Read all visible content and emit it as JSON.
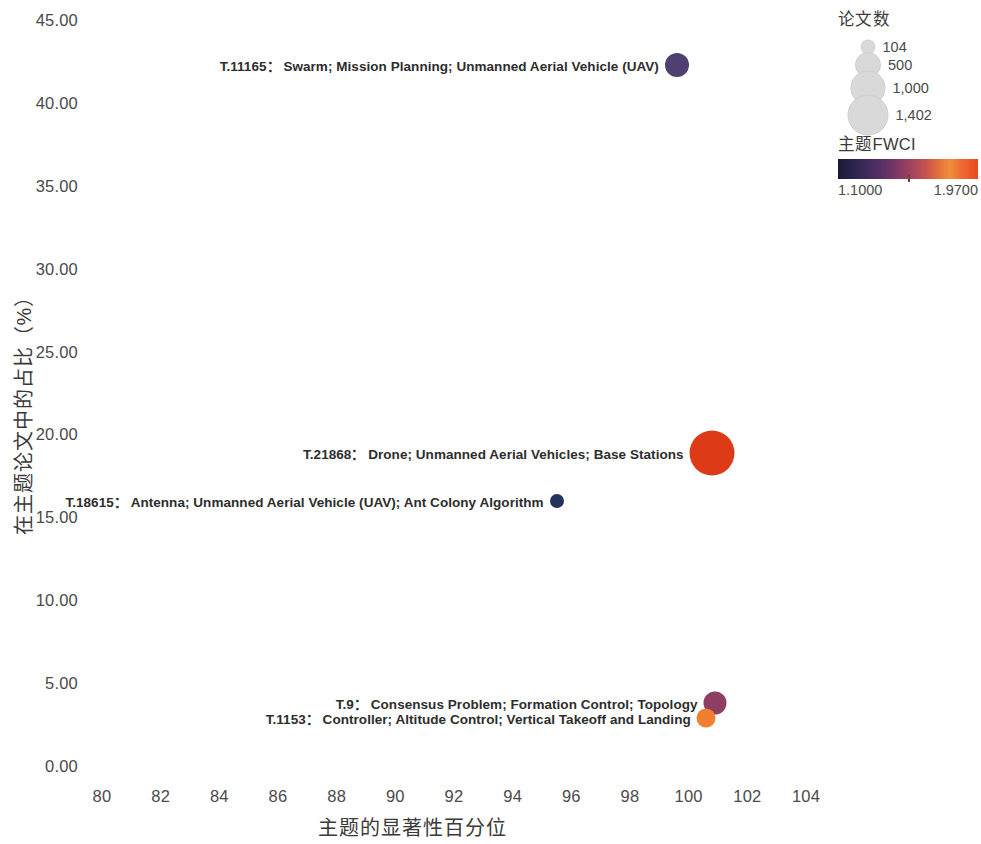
{
  "chart_data": {
    "type": "scatter",
    "title": "",
    "xlabel": "主题的显著性百分位",
    "ylabel": "在主题论文中的占比（%）",
    "xlim": [
      79,
      105
    ],
    "ylim": [
      0,
      45
    ],
    "xticks": [
      "80",
      "82",
      "84",
      "86",
      "88",
      "90",
      "92",
      "94",
      "96",
      "98",
      "100",
      "102",
      "104"
    ],
    "yticks": [
      "0.00",
      "5.00",
      "10.00",
      "15.00",
      "20.00",
      "25.00",
      "30.00",
      "35.00",
      "40.00",
      "45.00"
    ],
    "grid": false,
    "legend_position": "top-right",
    "points": [
      {
        "id": "T.11165",
        "label": "T.11165：",
        "keywords": "Swarm; Mission Planning; Unmanned Aerial Vehicle (UAV)",
        "x": 99.6,
        "y": 42.4,
        "papers": 330,
        "fwci": 1.22,
        "color": "#4e4070",
        "size_px": 24,
        "label_side": "left"
      },
      {
        "id": "T.21868",
        "label": "T.21868：",
        "keywords": "Drone; Unmanned Aerial Vehicles; Base Stations",
        "x": 100.8,
        "y": 19.0,
        "papers": 1402,
        "fwci": 1.95,
        "color": "#dd3a17",
        "size_px": 45,
        "label_side": "left"
      },
      {
        "id": "T.18615",
        "label": "T.18615：",
        "keywords": "Antenna; Unmanned Aerial Vehicle (UAV); Ant Colony Algorithm",
        "x": 95.5,
        "y": 16.1,
        "papers": 104,
        "fwci": 1.1,
        "color": "#23335c",
        "size_px": 14,
        "label_side": "left"
      },
      {
        "id": "T.9",
        "label": "T.9：",
        "keywords": "Consensus Problem; Formation Control; Topology",
        "x": 100.9,
        "y": 3.9,
        "papers": 260,
        "fwci": 1.45,
        "color": "#8e3d63",
        "size_px": 23,
        "label_side": "left"
      },
      {
        "id": "T.1153",
        "label": "T.1153：",
        "keywords": "Controller; Altitude Control; Vertical Takeoff and Landing",
        "x": 100.6,
        "y": 3.0,
        "papers": 170,
        "fwci": 1.8,
        "color": "#f07f32",
        "size_px": 19,
        "label_side": "left"
      }
    ]
  },
  "legend": {
    "size_title": "论文数",
    "size_items": [
      {
        "value": "104",
        "diameter": 13
      },
      {
        "value": "500",
        "diameter": 24
      },
      {
        "value": "1,000",
        "diameter": 33
      },
      {
        "value": "1,402",
        "diameter": 39
      }
    ],
    "color_title": "主题FWCI",
    "color_min": "1.1000",
    "color_max": "1.9700",
    "gradient_start": "#1b1b38",
    "gradient_end": "#e8491f"
  }
}
